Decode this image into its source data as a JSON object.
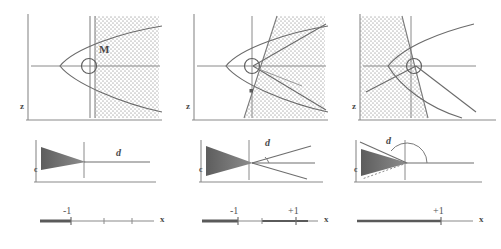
{
  "figure": {
    "title": "",
    "colors": {
      "line": "#6e6e6e",
      "curve": "#6b6b6b",
      "axis": "#8a8a8a",
      "stipple": "#b9b9b9",
      "wedge_dark": "#606060",
      "text": "#4a4a4a",
      "thick_segment": "#5a5a5a"
    },
    "columns": [
      {
        "id": "col-1",
        "top": {
          "axis_label_z": "z",
          "point_label": "M",
          "shading_side": "right",
          "boundary": "vertical-double-line",
          "curve": "rightward-parabola"
        },
        "middle": {
          "label_c": "c",
          "label_d": "d",
          "wedge": "converging-right",
          "rays": 1,
          "angle_arc": false
        },
        "bottom": {
          "axis_label": "x",
          "ticks": [
            "-1"
          ],
          "thick_from": "left-edge",
          "thick_to": "-1"
        }
      },
      {
        "id": "col-2",
        "top": {
          "axis_label_z": "z",
          "point_label": "",
          "shading_side": "right",
          "boundary": "slanted-line",
          "curve": "rightward-parabola"
        },
        "middle": {
          "label_c": "c",
          "label_d": "d",
          "wedge": "converging-right",
          "rays": 3,
          "angle_arc": true
        },
        "bottom": {
          "axis_label": "x",
          "ticks": [
            "-1",
            "+1"
          ],
          "thick_from": "left-edge",
          "thick_to": "-1",
          "thick2_from": "0",
          "thick2_to": "+1"
        }
      },
      {
        "id": "col-3",
        "top": {
          "axis_label_z": "z",
          "point_label": "",
          "shading_side": "left",
          "boundary": "steep-slanted-line",
          "curve": "rightward-parabola"
        },
        "middle": {
          "label_c": "c",
          "label_d": "d",
          "wedge": "converging-right",
          "rays": 2,
          "angle_arc": true,
          "angle_type": "obtuse"
        },
        "bottom": {
          "axis_label": "x",
          "ticks": [
            "+1"
          ],
          "thick_from": "left-edge",
          "thick_to": "+1"
        }
      }
    ]
  }
}
